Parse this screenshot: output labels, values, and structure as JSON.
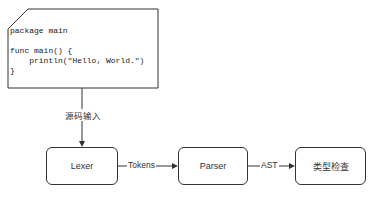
{
  "code_block": {
    "lines": [
      "package main",
      "",
      "func main() {",
      "    println(\"Hello, World.\")",
      "}"
    ]
  },
  "edges": {
    "source_input": "源码输入",
    "tokens": "Tokens",
    "ast": "AST"
  },
  "nodes": {
    "lexer": "Lexer",
    "parser": "Parser",
    "type_check": "类型检查"
  }
}
